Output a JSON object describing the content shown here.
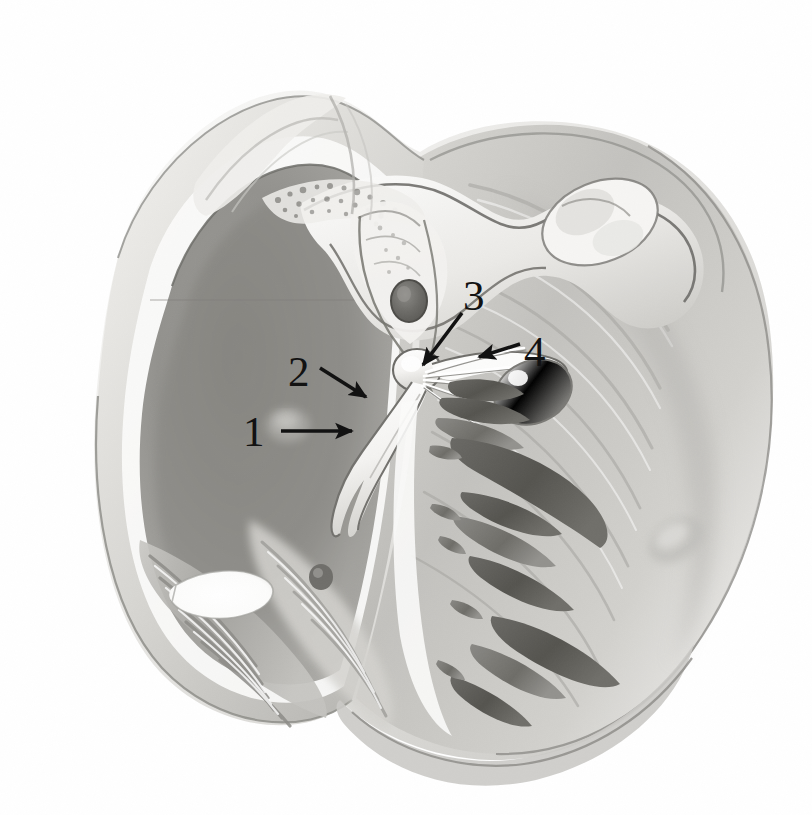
{
  "figure": {
    "kind": "anatomical-illustration",
    "rendering": "grayscale-pencil-airbrush",
    "background_color": "#ffffff",
    "width": 812,
    "height": 815,
    "caption": ""
  },
  "palette": {
    "background": "#ffffff",
    "paper_tint": "#fbfbfa",
    "ink_black": "#121212",
    "outline_gray": "#6e6e6e",
    "outline_dark": "#3d3d3d",
    "tissue_lightest": "#f4f3f1",
    "tissue_light": "#e3e2df",
    "tissue_mid": "#cfcecb",
    "tissue_mid_dark": "#b2b1ae",
    "tissue_dark": "#979693",
    "cavity_shadow": "#8d8c89",
    "cavity_deep": "#76756f",
    "trabecula_dark": "#5d5c58",
    "trabecula_darkest": "#4a4945",
    "highlight_white": "#fdfdfc"
  },
  "callouts": [
    {
      "id": "callout-1",
      "number": "1",
      "label_x": 243,
      "label_y": 410,
      "arrow": {
        "style": "straight",
        "x1": 281,
        "y1": 431,
        "x2": 358,
        "y2": 431,
        "direction": "right",
        "head": "solid-triangle"
      }
    },
    {
      "id": "callout-2",
      "number": "2",
      "label_x": 288,
      "label_y": 350,
      "arrow": {
        "style": "straight",
        "x1": 320,
        "y1": 368,
        "x2": 371,
        "y2": 401,
        "direction": "down-right",
        "head": "solid-triangle"
      }
    },
    {
      "id": "callout-3",
      "number": "3",
      "label_x": 463,
      "label_y": 274,
      "arrow": {
        "style": "straight",
        "x1": 462,
        "y1": 313,
        "x2": 418,
        "y2": 371,
        "direction": "down-left",
        "head": "solid-triangle"
      }
    },
    {
      "id": "callout-4",
      "number": "4",
      "label_x": 524,
      "label_y": 330,
      "arrow": {
        "style": "straight",
        "x1": 520,
        "y1": 344,
        "x2": 473,
        "y2": 359,
        "direction": "left",
        "head": "solid-triangle"
      }
    }
  ],
  "structures": [
    {
      "id": "atrial-wall-left",
      "name": "left-atrial-wall-cut-edge"
    },
    {
      "id": "atrial-cavity",
      "name": "atrial-cavity-shadow"
    },
    {
      "id": "pectinate-muscles",
      "name": "pectinate-muscle-ridges"
    },
    {
      "id": "fossa-opening",
      "name": "oval-foramen-opening"
    },
    {
      "id": "superior-vessel",
      "name": "great-vessel-root-upper"
    },
    {
      "id": "vessel-lumen-right",
      "name": "vessel-lumen-upper-right"
    },
    {
      "id": "coronary-sinus-ostium",
      "name": "coronary-sinus-ostium"
    },
    {
      "id": "valve-leaflet-anterior",
      "name": "anterior-valve-leaflet"
    },
    {
      "id": "valve-leaflet-septal",
      "name": "septal-valve-leaflet"
    },
    {
      "id": "chordae-tendineae",
      "name": "chordae-tendineae"
    },
    {
      "id": "papillary-muscle",
      "name": "papillary-muscle"
    },
    {
      "id": "trabeculae-carneae",
      "name": "trabeculae-carneae"
    },
    {
      "id": "ventricular-wall",
      "name": "ventricular-free-wall"
    },
    {
      "id": "apex",
      "name": "cardiac-apex"
    }
  ]
}
